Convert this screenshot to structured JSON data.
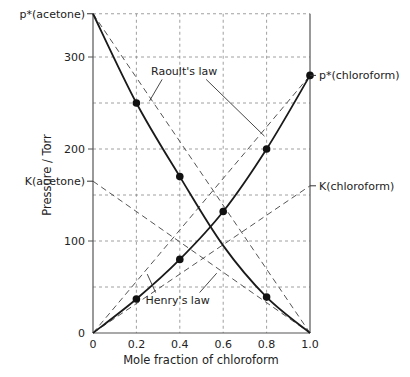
{
  "chart_data": {
    "type": "line",
    "title": "",
    "xlabel": "Mole fraction of chloroform",
    "ylabel": "Pressure / Torr",
    "xlim": [
      0,
      1.0
    ],
    "ylim": [
      0,
      347
    ],
    "grid": true,
    "x_ticks": [
      0,
      0.2,
      0.4,
      0.6,
      0.8,
      1.0
    ],
    "x_tick_labels": [
      "0",
      "0.2",
      "0.4",
      "0.6",
      "0.8",
      "1.0"
    ],
    "y_ticks": [
      0,
      100,
      200,
      300
    ],
    "y_tick_labels": [
      "0",
      "100",
      "200",
      "300"
    ],
    "y_grid_values": [
      50,
      100,
      150,
      200,
      250,
      300,
      347
    ],
    "x_grid_values": [
      0.2,
      0.4,
      0.6,
      0.8
    ],
    "series": [
      {
        "name": "acetone vapour pressure",
        "style": "solid",
        "x": [
          0,
          0.2,
          0.4,
          0.6,
          0.8,
          1.0
        ],
        "y": [
          347,
          250,
          170,
          95,
          39,
          0
        ],
        "markers_x": [
          0.2,
          0.4,
          0.8
        ],
        "markers_y": [
          250,
          170,
          39
        ]
      },
      {
        "name": "chloroform vapour pressure",
        "style": "solid",
        "x": [
          0,
          0.2,
          0.4,
          0.6,
          0.8,
          1.0
        ],
        "y": [
          0,
          37,
          80,
          132,
          200,
          280
        ],
        "markers_x": [
          0.2,
          0.4,
          0.6,
          0.8,
          1.0
        ],
        "markers_y": [
          37,
          80,
          132,
          200,
          280
        ]
      },
      {
        "name": "Raoult's law (acetone)",
        "style": "dashed",
        "x": [
          0,
          1.0
        ],
        "y": [
          347,
          0
        ]
      },
      {
        "name": "Raoult's law (chloroform)",
        "style": "dashed",
        "x": [
          0,
          1.0
        ],
        "y": [
          0,
          280
        ]
      },
      {
        "name": "Henry's law (acetone)",
        "style": "dashed",
        "x": [
          0,
          1.0
        ],
        "y": [
          165,
          0
        ]
      },
      {
        "name": "Henry's law (chloroform)",
        "style": "dashed",
        "x": [
          0,
          1.0
        ],
        "y": [
          0,
          160
        ]
      }
    ],
    "annotations": [
      {
        "text": "p*(acetone)",
        "x": 0,
        "y": 347,
        "side": "left"
      },
      {
        "text": "K(acetone)",
        "x": 0,
        "y": 165,
        "side": "left"
      },
      {
        "text": "p*(chloroform)",
        "x": 1.0,
        "y": 280,
        "side": "right"
      },
      {
        "text": "K(chloroform)",
        "x": 1.0,
        "y": 160,
        "side": "right"
      },
      {
        "text": "Raoult's law",
        "x": 0.42,
        "y": 280,
        "pointers": [
          [
            0.26,
            252
          ],
          [
            0.79,
            214
          ]
        ]
      },
      {
        "text": "Henry's law",
        "x": 0.39,
        "y": 32,
        "pointers": [
          [
            0.25,
            64
          ],
          [
            0.57,
            65
          ]
        ]
      }
    ]
  }
}
